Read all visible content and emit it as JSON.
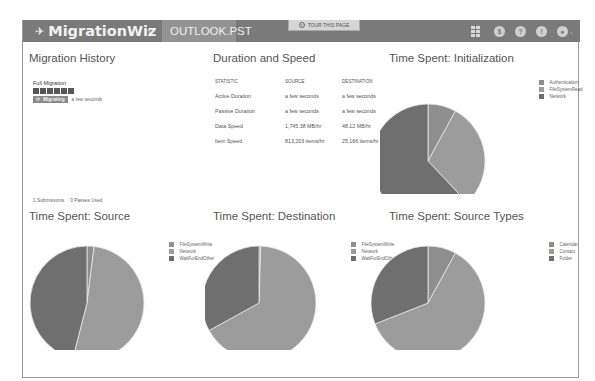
{
  "header": {
    "app_name": "MigrationWiz",
    "logo_icon": "plane-icon",
    "up_icon": "↑",
    "file_tab": "OUTLOOK.PST",
    "tour_label": "TOUR THIS PAGE",
    "tour_icon": "?",
    "nav_icons": [
      {
        "name": "dashboard-icon",
        "glyph": ""
      },
      {
        "name": "dollar-icon",
        "glyph": "$"
      },
      {
        "name": "help-icon",
        "glyph": "?"
      },
      {
        "name": "info-icon",
        "glyph": "!"
      },
      {
        "name": "user-icon",
        "glyph": "●"
      }
    ],
    "user_caret": "⌄"
  },
  "migration_history": {
    "title": "Migration History",
    "entry_type": "Full Migration",
    "item_icons": [
      "mail-icon",
      "calendar-icon",
      "contact-icon",
      "task-icon",
      "note-icon",
      "folder-icon"
    ],
    "status_badge": "Migrating",
    "status_icon": "⟳",
    "time_ago": "a few seconds",
    "submissions": "1 Submissions",
    "passes_used": "0 Passes Used"
  },
  "duration_speed": {
    "title": "Duration and Speed",
    "columns": [
      "STATISTIC",
      "SOURCE",
      "DESTINATION"
    ],
    "rows": [
      [
        "Active Duration",
        "a few seconds",
        "a few seconds"
      ],
      [
        "Passive Duration",
        "a few seconds",
        "a few seconds"
      ],
      [
        "Data Speed",
        "1,745.38 MB/hr",
        "48.12 MB/hr"
      ],
      [
        "Item Speed",
        "813,203 items/hr",
        "25,166 items/hr"
      ]
    ]
  },
  "colors": {
    "topbar": "#7a7a7a",
    "slice_dark": "#6f6f6f",
    "slice_mid": "#8e8e8e",
    "slice_light": "#9c9c9c"
  },
  "chart_data": [
    {
      "type": "pie",
      "title": "Time Spent: Initialization",
      "categories": [
        "Authentication",
        "FileSystemRead",
        "Network"
      ],
      "values": [
        8,
        30,
        62
      ],
      "legend_position": "right"
    },
    {
      "type": "pie",
      "title": "Time Spent: Source",
      "categories": [
        "FileSystemWrite",
        "Network",
        "WaitForEndOther"
      ],
      "values": [
        2,
        52,
        46
      ],
      "legend_position": "right"
    },
    {
      "type": "pie",
      "title": "Time Spent: Destination",
      "categories": [
        "FileSystemWrite",
        "Network",
        "WaitForEndOther"
      ],
      "values": [
        0.5,
        66.5,
        33
      ],
      "legend_position": "right"
    },
    {
      "type": "pie",
      "title": "Time Spent: Source Types",
      "categories": [
        "Calendar",
        "Contact",
        "Folder"
      ],
      "values": [
        8,
        61,
        31
      ],
      "legend_position": "right"
    }
  ]
}
